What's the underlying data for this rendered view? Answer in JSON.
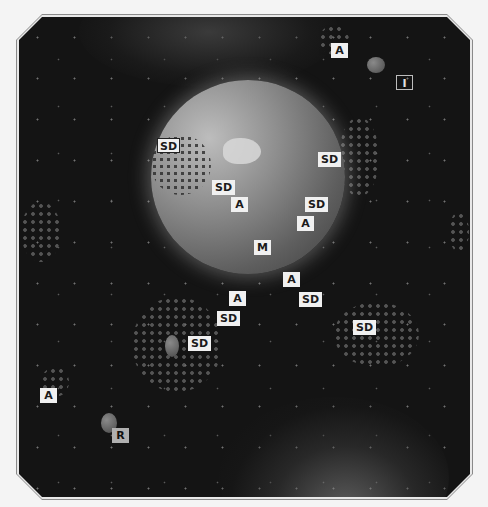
{
  "map": {
    "background": "#151515",
    "frame_color": "#8a8a8a",
    "planet": {
      "name": "planet",
      "color": "#8f8f8f"
    }
  },
  "labels": [
    {
      "text": "A",
      "x": 331,
      "y": 43,
      "style": "plain"
    },
    {
      "text": "I",
      "x": 396,
      "y": 75,
      "style": "outline"
    },
    {
      "text": "SD",
      "x": 157,
      "y": 138,
      "style": "boxed"
    },
    {
      "text": "SD",
      "x": 318,
      "y": 152,
      "style": "plain"
    },
    {
      "text": "SD",
      "x": 212,
      "y": 180,
      "style": "plain"
    },
    {
      "text": "A",
      "x": 231,
      "y": 197,
      "style": "plain"
    },
    {
      "text": "SD",
      "x": 305,
      "y": 197,
      "style": "plain"
    },
    {
      "text": "A",
      "x": 297,
      "y": 216,
      "style": "plain"
    },
    {
      "text": "M",
      "x": 254,
      "y": 240,
      "style": "plain"
    },
    {
      "text": "A",
      "x": 283,
      "y": 272,
      "style": "plain"
    },
    {
      "text": "A",
      "x": 229,
      "y": 291,
      "style": "plain"
    },
    {
      "text": "SD",
      "x": 299,
      "y": 292,
      "style": "plain"
    },
    {
      "text": "SD",
      "x": 217,
      "y": 311,
      "style": "plain"
    },
    {
      "text": "SD",
      "x": 188,
      "y": 336,
      "style": "plain"
    },
    {
      "text": "SD",
      "x": 353,
      "y": 320,
      "style": "plain"
    },
    {
      "text": "A",
      "x": 40,
      "y": 388,
      "style": "plain"
    },
    {
      "text": "R",
      "x": 112,
      "y": 428,
      "style": "grey"
    }
  ]
}
